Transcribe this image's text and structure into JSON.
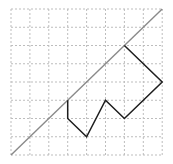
{
  "diagram": {
    "grid": {
      "cols": 8,
      "rows": 8,
      "origin_px": [
        11,
        9
      ],
      "cell_w": 18.9,
      "cell_h": 18.25,
      "line_color": "#bdbdbd",
      "dash": "2,2"
    },
    "diagonal": {
      "from": [
        0,
        8
      ],
      "to": [
        8,
        0
      ],
      "color": "#8a8a8a",
      "width": 1.4
    },
    "polyline": {
      "points": [
        [
          3,
          5
        ],
        [
          3,
          6
        ],
        [
          4,
          7
        ],
        [
          5,
          5
        ],
        [
          6,
          6
        ],
        [
          8,
          4
        ],
        [
          6,
          2
        ]
      ],
      "color": "#1e1e1e",
      "width": 1.5
    }
  }
}
